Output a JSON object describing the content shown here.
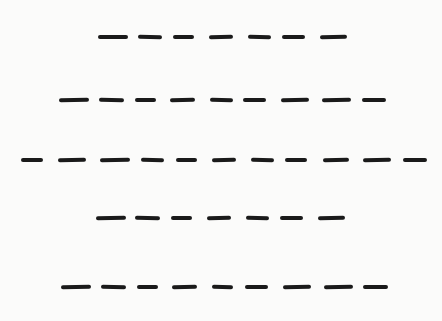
{
  "figure": {
    "stroke_color": "#1a1a1a",
    "background_color": "#fbfbfa",
    "rows": [
      {
        "y": 37,
        "count": 7,
        "dashes": [
          [
            98,
            128,
            0
          ],
          [
            138,
            162,
            1
          ],
          [
            173,
            194,
            0
          ],
          [
            209,
            233,
            -1.5
          ],
          [
            248,
            271,
            1.5
          ],
          [
            282,
            305,
            0
          ],
          [
            320,
            347,
            -1
          ]
        ]
      },
      {
        "y": 100,
        "count": 9,
        "dashes": [
          [
            59,
            89,
            -1
          ],
          [
            99,
            124,
            1
          ],
          [
            135,
            156,
            0
          ],
          [
            170,
            195,
            -1.5
          ],
          [
            210,
            233,
            1.5
          ],
          [
            243,
            266,
            0
          ],
          [
            281,
            309,
            -1
          ],
          [
            322,
            351,
            -1
          ],
          [
            362,
            386,
            0.5
          ]
        ]
      },
      {
        "y": 160,
        "count": 11,
        "dashes": [
          [
            21,
            43,
            0
          ],
          [
            58,
            86,
            -1.5
          ],
          [
            100,
            130,
            -1
          ],
          [
            141,
            164,
            1
          ],
          [
            176,
            197,
            0
          ],
          [
            212,
            236,
            -1.5
          ],
          [
            251,
            274,
            1.5
          ],
          [
            285,
            307,
            0
          ],
          [
            323,
            349,
            -1.5
          ],
          [
            363,
            391,
            -1
          ],
          [
            403,
            427,
            0.5
          ]
        ]
      },
      {
        "y": 218,
        "count": 7,
        "dashes": [
          [
            96,
            126,
            -1
          ],
          [
            135,
            160,
            1
          ],
          [
            171,
            192,
            0
          ],
          [
            207,
            231,
            -1.5
          ],
          [
            246,
            269,
            1.5
          ],
          [
            280,
            303,
            0
          ],
          [
            318,
            345,
            -1
          ]
        ]
      },
      {
        "y": 287,
        "count": 9,
        "dashes": [
          [
            61,
            91,
            -1
          ],
          [
            101,
            126,
            1
          ],
          [
            137,
            158,
            0
          ],
          [
            172,
            197,
            -1.5
          ],
          [
            212,
            233,
            1.5
          ],
          [
            245,
            268,
            0
          ],
          [
            283,
            311,
            -1
          ],
          [
            324,
            353,
            -1
          ],
          [
            363,
            388,
            0.5
          ]
        ]
      }
    ]
  }
}
